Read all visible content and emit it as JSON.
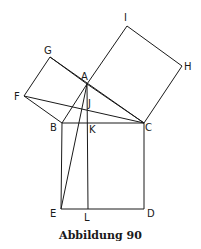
{
  "caption": "Abbildung 90",
  "points": {
    "A": [
      87,
      84
    ],
    "B": [
      62,
      123
    ],
    "C": [
      144,
      123
    ],
    "D": [
      144,
      209
    ],
    "E": [
      61,
      209
    ],
    "L": [
      88,
      209
    ],
    "K": [
      88,
      123
    ],
    "F": [
      24,
      96
    ],
    "G": [
      50,
      57
    ],
    "I": [
      127,
      26
    ],
    "H": [
      182,
      66
    ],
    "J": [
      83,
      109
    ]
  },
  "labels": [
    {
      "text": "I",
      "x": 124,
      "y": 21
    },
    {
      "text": "G",
      "x": 44,
      "y": 54
    },
    {
      "text": "H",
      "x": 184,
      "y": 70
    },
    {
      "text": "A",
      "x": 81,
      "y": 80
    },
    {
      "text": "F",
      "x": 14,
      "y": 100
    },
    {
      "text": "J",
      "x": 88,
      "y": 107
    },
    {
      "text": "B",
      "x": 50,
      "y": 131
    },
    {
      "text": "K",
      "x": 89,
      "y": 133
    },
    {
      "text": "C",
      "x": 145,
      "y": 131
    },
    {
      "text": "E",
      "x": 50,
      "y": 217
    },
    {
      "text": "L",
      "x": 84,
      "y": 221
    },
    {
      "text": "D",
      "x": 147,
      "y": 217
    }
  ],
  "segments": [
    [
      "B",
      "C"
    ],
    [
      "C",
      "D"
    ],
    [
      "D",
      "E"
    ],
    [
      "E",
      "B"
    ],
    [
      "A",
      "B"
    ],
    [
      "A",
      "C"
    ],
    [
      "B",
      "F"
    ],
    [
      "F",
      "G"
    ],
    [
      "G",
      "A"
    ],
    [
      "A",
      "I"
    ],
    [
      "I",
      "H"
    ],
    [
      "H",
      "C"
    ],
    [
      "A",
      "L"
    ],
    [
      "A",
      "E"
    ],
    [
      "F",
      "C"
    ],
    [
      "G",
      "C"
    ]
  ]
}
